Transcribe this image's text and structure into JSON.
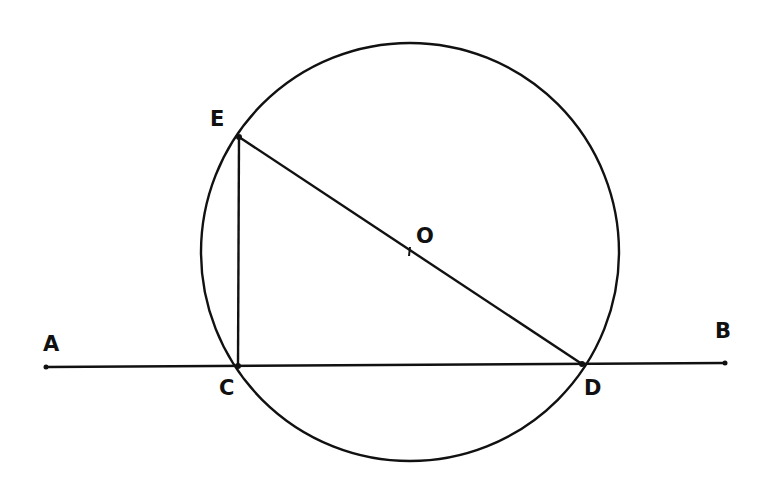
{
  "diagram": {
    "type": "geometry",
    "stroke_color": "#111111",
    "background": "#ffffff",
    "circle": {
      "center_label": "O",
      "cx": 410,
      "cy": 252,
      "r": 209
    },
    "points": {
      "A": {
        "label": "A",
        "x": 46,
        "y": 367,
        "lx": 43,
        "ly": 351
      },
      "B": {
        "label": "B",
        "x": 725,
        "y": 363,
        "lx": 715,
        "ly": 338
      },
      "C": {
        "label": "C",
        "x": 238,
        "y": 366,
        "lx": 219,
        "ly": 395
      },
      "D": {
        "label": "D",
        "x": 582,
        "y": 364,
        "lx": 584,
        "ly": 395
      },
      "E": {
        "label": "E",
        "x": 239,
        "y": 137,
        "lx": 210,
        "ly": 126
      },
      "O": {
        "label": "O",
        "x": 410,
        "y": 251,
        "lx": 416,
        "ly": 243
      }
    },
    "segments": [
      {
        "from": "A",
        "to": "B"
      },
      {
        "from": "E",
        "to": "C"
      },
      {
        "from": "E",
        "to": "D"
      }
    ]
  }
}
